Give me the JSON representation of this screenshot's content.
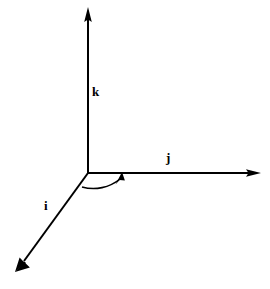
{
  "figure": {
    "title": "",
    "type": "vector-basis-diagram",
    "background_color": "#ffffff",
    "stroke_color": "#000000",
    "width": 270,
    "height": 289
  },
  "axes": {
    "origin": {
      "x": 88,
      "y": 173
    },
    "items": [
      {
        "id": "k",
        "label": "k",
        "name": "k-axis",
        "direction": "up",
        "tip": {
          "x": 88,
          "y": 8
        },
        "label_position": {
          "x": 92,
          "y": 85
        }
      },
      {
        "id": "j",
        "label": "j",
        "name": "j-axis",
        "direction": "right",
        "tip": {
          "x": 261,
          "y": 173
        },
        "label_position": {
          "x": 166,
          "y": 151
        }
      },
      {
        "id": "i",
        "label": "i",
        "name": "i-axis",
        "direction": "down-left",
        "tip": {
          "x": 15,
          "y": 272
        },
        "label_position": {
          "x": 44,
          "y": 199
        }
      }
    ]
  },
  "angle_arc": {
    "name": "angle-arc-i-to-j",
    "label": "",
    "from_axis": "i",
    "to_axis": "j",
    "arrow_direction": "counterclockwise-to-j",
    "start": {
      "x": 82,
      "y": 187
    },
    "end": {
      "x": 122,
      "y": 174
    },
    "radius": 40
  },
  "style": {
    "line_width": 2,
    "arrow_head_length": 14,
    "arrow_head_width": 8,
    "label_font_size": 13
  }
}
